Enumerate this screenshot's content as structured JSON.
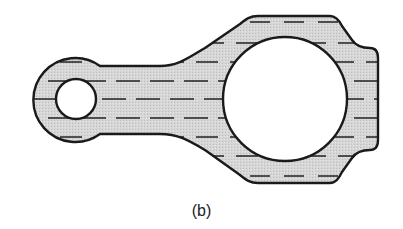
{
  "figure": {
    "caption": "(b)",
    "colors": {
      "fill": "#d4d4d4",
      "outline": "#1a1a1a",
      "hatch": "#222222",
      "background": "#ffffff"
    },
    "parts": {
      "small_end": {
        "cx": 76,
        "cy": 99,
        "outer_r": 42,
        "hole_r": 20
      },
      "big_end": {
        "cx": 285,
        "cy": 99,
        "hole_r": 62
      },
      "shank": {
        "top_y": 66,
        "bottom_y": 134
      }
    },
    "hatch_rows_y": [
      22,
      43,
      62,
      81,
      99,
      118,
      137,
      156,
      176
    ]
  }
}
